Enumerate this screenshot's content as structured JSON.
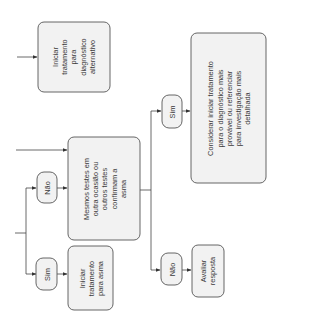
{
  "diagram": {
    "orientation": "rotated-90-ccw",
    "nodes": {
      "alt_treatment": {
        "label": "Iniciar\ntratamento\npara\ndiagnóstico\nalternativo"
      },
      "repeat_tests": {
        "label": "Mesmos testes em\noutra ocasião ou\noutros testes\nconfirmam a\nasma"
      },
      "yes_left": {
        "label": "Sim"
      },
      "no_left": {
        "label": "Não"
      },
      "asthma_treatment": {
        "label": "Iniciar\ntratamento\npara asma"
      },
      "yes_right": {
        "label": "Sim"
      },
      "no_right": {
        "label": "Não"
      },
      "consider": {
        "label": "Considerar iniciar tratamento\npara o diagnóstico mais\nprovável ou referenciar\npara investigação mais\ndetalhada"
      },
      "evaluate": {
        "label": "Avaliar\nresposta"
      }
    },
    "colors": {
      "box_fill": "#f2f2f2",
      "stroke": "#555555",
      "text": "#3a3a3a"
    }
  }
}
